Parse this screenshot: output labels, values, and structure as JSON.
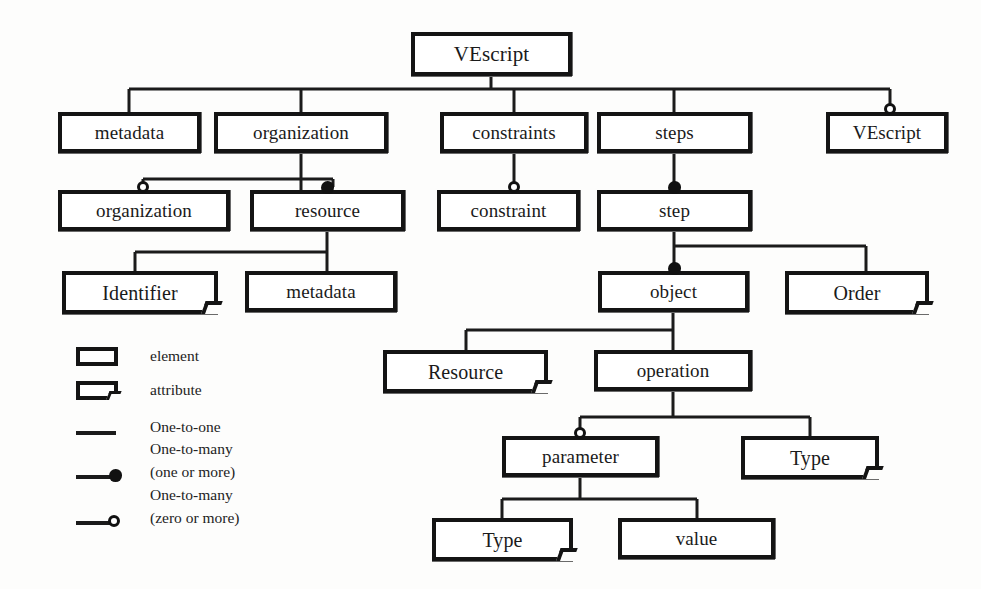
{
  "diagram": {
    "colors": {
      "ink": "#141414",
      "paper": "#fdfdfc",
      "text": "#232323"
    },
    "nodes": [
      {
        "id": "root",
        "label": "VEscript",
        "kind": "element",
        "x": 411,
        "y": 32,
        "w": 161,
        "h": 44,
        "font": 21,
        "marker": "none"
      },
      {
        "id": "metadata1",
        "label": "metadata",
        "kind": "element",
        "x": 58,
        "y": 112,
        "w": 143,
        "h": 41,
        "font": 19,
        "marker": "none"
      },
      {
        "id": "organization1",
        "label": "organization",
        "kind": "element",
        "x": 214,
        "y": 112,
        "w": 174,
        "h": 41,
        "font": 19,
        "marker": "none"
      },
      {
        "id": "constraints",
        "label": "constraints",
        "kind": "element",
        "x": 440,
        "y": 112,
        "w": 148,
        "h": 41,
        "font": 19,
        "marker": "none"
      },
      {
        "id": "steps",
        "label": "steps",
        "kind": "element",
        "x": 597,
        "y": 112,
        "w": 155,
        "h": 41,
        "font": 19,
        "marker": "none"
      },
      {
        "id": "vescript2",
        "label": "VEscript",
        "kind": "element",
        "x": 826,
        "y": 112,
        "w": 122,
        "h": 41,
        "font": 19,
        "marker": "zero-or-more"
      },
      {
        "id": "organization2",
        "label": "organization",
        "kind": "element",
        "x": 58,
        "y": 190,
        "w": 172,
        "h": 41,
        "font": 19,
        "marker": "zero-or-more"
      },
      {
        "id": "resource",
        "label": "resource",
        "kind": "element",
        "x": 250,
        "y": 190,
        "w": 155,
        "h": 41,
        "font": 19,
        "marker": "one-or-more"
      },
      {
        "id": "constraint",
        "label": "constraint",
        "kind": "element",
        "x": 437,
        "y": 190,
        "w": 143,
        "h": 41,
        "font": 19,
        "marker": "zero-or-more"
      },
      {
        "id": "step",
        "label": "step",
        "kind": "element",
        "x": 597,
        "y": 190,
        "w": 155,
        "h": 41,
        "font": 19,
        "marker": "one-or-more"
      },
      {
        "id": "identifier",
        "label": "Identifier",
        "kind": "attribute",
        "x": 62,
        "y": 271,
        "w": 156,
        "h": 43,
        "font": 20,
        "marker": "none"
      },
      {
        "id": "metadata2",
        "label": "metadata",
        "kind": "element",
        "x": 245,
        "y": 271,
        "w": 152,
        "h": 41,
        "font": 19,
        "marker": "none"
      },
      {
        "id": "object",
        "label": "object",
        "kind": "element",
        "x": 598,
        "y": 271,
        "w": 151,
        "h": 41,
        "font": 19,
        "marker": "one-or-more"
      },
      {
        "id": "order",
        "label": "Order",
        "kind": "attribute",
        "x": 785,
        "y": 271,
        "w": 144,
        "h": 43,
        "font": 20,
        "marker": "none"
      },
      {
        "id": "resourceAttr",
        "label": "Resource",
        "kind": "attribute",
        "x": 383,
        "y": 350,
        "w": 165,
        "h": 43,
        "font": 20,
        "marker": "none"
      },
      {
        "id": "operation",
        "label": "operation",
        "kind": "element",
        "x": 594,
        "y": 350,
        "w": 158,
        "h": 41,
        "font": 19,
        "marker": "none"
      },
      {
        "id": "parameter",
        "label": "parameter",
        "kind": "element",
        "x": 502,
        "y": 436,
        "w": 157,
        "h": 41,
        "font": 19,
        "marker": "zero-or-more"
      },
      {
        "id": "typeOp",
        "label": "Type",
        "kind": "attribute",
        "x": 741,
        "y": 436,
        "w": 138,
        "h": 43,
        "font": 20,
        "marker": "none"
      },
      {
        "id": "typeParam",
        "label": "Type",
        "kind": "attribute",
        "x": 432,
        "y": 518,
        "w": 141,
        "h": 43,
        "font": 20,
        "marker": "none"
      },
      {
        "id": "value",
        "label": "value",
        "kind": "element",
        "x": 618,
        "y": 518,
        "w": 157,
        "h": 41,
        "font": 19,
        "marker": "none"
      }
    ],
    "legend": {
      "element_label": "element",
      "attribute_label": "attribute",
      "one_to_one_label": "One-to-one",
      "one_to_many_one_line1": "One-to-many",
      "one_to_many_one_line2": "(one or more)",
      "one_to_many_zero_line1": "One-to-many",
      "one_to_many_zero_line2": "(zero or more)"
    }
  }
}
